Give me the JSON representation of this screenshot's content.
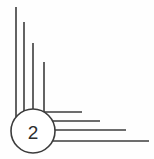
{
  "canvas": {
    "width": 154,
    "height": 159,
    "background_color": "#fefefe",
    "stroke_color": "#3c3c3c",
    "stroke_width": 1.6
  },
  "node": {
    "label": "2",
    "shape": "circle",
    "center_x": 33,
    "center_y": 131,
    "radius": 22,
    "fill_color": "#ffffff",
    "stroke_color": "#3c3c3c",
    "label_color": "#2e2e2e",
    "label_font_size": 19
  },
  "vertical_lines": [
    {
      "name": "vertical-line-1",
      "x": 16,
      "y_top": 7,
      "y_bottom": 131
    },
    {
      "name": "vertical-line-2",
      "x": 24,
      "y_top": 22,
      "y_bottom": 131
    },
    {
      "name": "vertical-line-3",
      "x": 33,
      "y_top": 43,
      "y_bottom": 131
    },
    {
      "name": "vertical-line-4",
      "x": 44,
      "y_top": 62,
      "y_bottom": 131
    }
  ],
  "horizontal_lines": [
    {
      "name": "horizontal-line-1",
      "y": 112,
      "x_start": 33,
      "x_end": 82
    },
    {
      "name": "horizontal-line-2",
      "y": 121,
      "x_start": 33,
      "x_end": 100
    },
    {
      "name": "horizontal-line-3",
      "y": 130,
      "x_start": 33,
      "x_end": 126
    },
    {
      "name": "horizontal-line-4",
      "y": 141,
      "x_start": 33,
      "x_end": 149
    }
  ],
  "counts": {
    "vertical_branches": 4,
    "horizontal_branches": 4
  }
}
